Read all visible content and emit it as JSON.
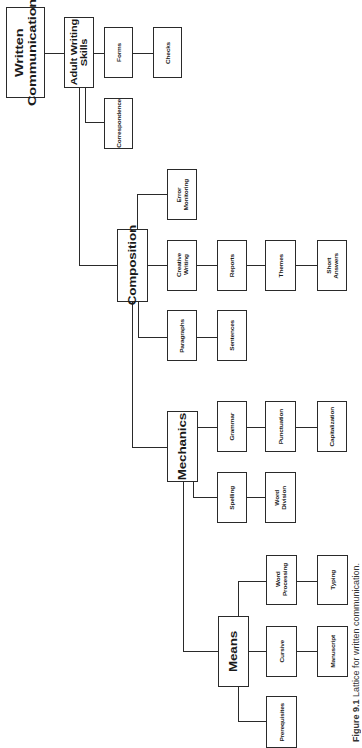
{
  "diagram": {
    "root": "Written Communication",
    "nodes": {
      "written_communication": "Written\nCommunication",
      "adult_writing_skills": "Adult Writing\nSkills",
      "forms": "Forms",
      "checks": "Checks",
      "correspondence": "Correspondence",
      "composition": "Composition",
      "error_monitoring": "Error\nMonitoring",
      "creative_writing": "Creative\nWriting",
      "reports": "Reports",
      "themes": "Themes",
      "short_answers": "Short\nAnswers",
      "paragraphs": "Paragraphs",
      "sentences": "Sentences",
      "mechanics": "Mechanics",
      "grammar": "Grammar",
      "punctuation": "Punctuation",
      "capitalization": "Capitalization",
      "spelling": "Spelling",
      "word_division": "Word\nDivision",
      "means": "Means",
      "word_processing": "Word\nProcessing",
      "typing": "Typing",
      "cursive": "Cursive",
      "manuscript": "Manuscript",
      "prerequisites": "Prerequisites"
    },
    "edges": [
      [
        "Written Communication",
        "Adult Writing Skills"
      ],
      [
        "Adult Writing Skills",
        "Forms"
      ],
      [
        "Forms",
        "Checks"
      ],
      [
        "Adult Writing Skills",
        "Correspondence"
      ],
      [
        "Adult Writing Skills",
        "Composition"
      ],
      [
        "Composition",
        "Error Monitoring"
      ],
      [
        "Composition",
        "Creative Writing"
      ],
      [
        "Creative Writing",
        "Reports"
      ],
      [
        "Reports",
        "Themes"
      ],
      [
        "Themes",
        "Short Answers"
      ],
      [
        "Composition",
        "Paragraphs"
      ],
      [
        "Paragraphs",
        "Sentences"
      ],
      [
        "Composition",
        "Mechanics"
      ],
      [
        "Mechanics",
        "Grammar"
      ],
      [
        "Grammar",
        "Punctuation"
      ],
      [
        "Punctuation",
        "Capitalization"
      ],
      [
        "Mechanics",
        "Spelling"
      ],
      [
        "Spelling",
        "Word Division"
      ],
      [
        "Mechanics",
        "Means"
      ],
      [
        "Means",
        "Word Processing"
      ],
      [
        "Word Processing",
        "Typing"
      ],
      [
        "Means",
        "Cursive"
      ],
      [
        "Cursive",
        "Manuscript"
      ],
      [
        "Means",
        "Prerequisites"
      ]
    ]
  },
  "caption": {
    "figure_label": "Figure 9.1",
    "text": " Lattice for written communication."
  }
}
